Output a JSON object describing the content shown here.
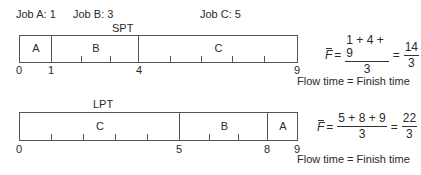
{
  "jobs": [
    {
      "label": "Job A: 1",
      "name": "A",
      "time": 1
    },
    {
      "label": "Job B: 3",
      "name": "B",
      "time": 3
    },
    {
      "label": "Job C: 5",
      "name": "C",
      "time": 5
    }
  ],
  "spt": {
    "title": "SPT",
    "segments": [
      {
        "job": "A",
        "start": 0,
        "end": 1
      },
      {
        "job": "B",
        "start": 1,
        "end": 4
      },
      {
        "job": "C",
        "start": 4,
        "end": 9
      }
    ],
    "tick_labels": [
      "0",
      "1",
      "4",
      "9"
    ],
    "formula": {
      "symbol": "F",
      "eq1": "=",
      "numerator": "1 + 4 + 9",
      "denominator": "3",
      "eq2": "=",
      "result_num": "14",
      "result_den": "3"
    },
    "note": "Flow time = Finish time"
  },
  "lpt": {
    "title": "LPT",
    "segments": [
      {
        "job": "C",
        "start": 0,
        "end": 5
      },
      {
        "job": "B",
        "start": 5,
        "end": 8
      },
      {
        "job": "A",
        "start": 8,
        "end": 9
      }
    ],
    "tick_labels": [
      "0",
      "5",
      "8",
      "9"
    ],
    "formula": {
      "symbol": "F",
      "eq1": "=",
      "numerator": "5 + 8 + 9",
      "denominator": "3",
      "eq2": "=",
      "result_num": "22",
      "result_den": "3"
    },
    "note": "Flow time = Finish time"
  },
  "colors": {
    "line": "#555555",
    "text": "#2a2a2a",
    "background": "#ffffff"
  }
}
